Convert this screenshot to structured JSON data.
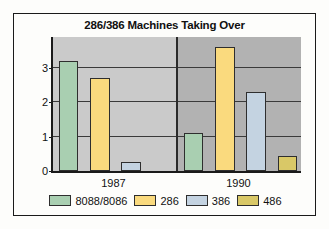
{
  "figure": {
    "frame_color": "#1a1a1a",
    "page_background": "#fdfdfb"
  },
  "chart_data": {
    "type": "bar",
    "title": "286/386 Machines Taking Over",
    "xlabel": "",
    "ylabel": "",
    "categories": [
      "1987",
      "1990"
    ],
    "series": [
      {
        "name": "8088/8086",
        "color": "#a9cfb1",
        "values": [
          3.2,
          1.1
        ]
      },
      {
        "name": "286",
        "color": "#fada7e",
        "values": [
          2.7,
          3.6
        ]
      },
      {
        "name": "386",
        "color": "#c4d3e1",
        "values": [
          0.25,
          2.3
        ]
      },
      {
        "name": "486",
        "color": "#d9c867",
        "values": [
          0.0,
          0.45
        ]
      }
    ],
    "ylim": [
      0,
      3.9
    ],
    "yticks": [
      0,
      1,
      2,
      3
    ],
    "ytick_labels": [
      "0",
      "1",
      "2",
      "3"
    ],
    "grid": true,
    "gridlines_at": [
      1,
      2,
      3
    ],
    "legend_position": "bottom",
    "panel_backgrounds": [
      "#cacaca",
      "#b2b2b2"
    ],
    "bar_edge_color": "#2e2e2e",
    "axis_color": "#1a1a1a"
  }
}
